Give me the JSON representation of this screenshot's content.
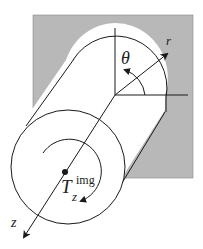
{
  "diagram": {
    "type": "cylindrical-coordinates-torque",
    "labels": {
      "theta": "θ",
      "r": "r",
      "z": "z",
      "torque_main": "T",
      "torque_sub": "z",
      "torque_sup": "img"
    },
    "colors": {
      "background_plane": "#b8b8b8",
      "cylinder_fill": "#ffffff",
      "stroke": "#1a1a1a"
    }
  }
}
